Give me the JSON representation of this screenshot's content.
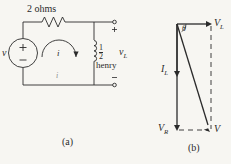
{
  "figure": {
    "background_color": "#f7f6f2",
    "ink_color": "#2b2b2b",
    "captions": {
      "left": "(a)",
      "right": "(b)"
    }
  },
  "circuit": {
    "name": "RL series circuit",
    "source_label": "v",
    "source_plus": "+",
    "source_minus": "−",
    "resistor_label": "2 ohms",
    "inductor_value_numerator": "1",
    "inductor_value_denominator": "2",
    "inductor_unit": "henry",
    "mesh_current_label": "i",
    "branch_current_label": "i",
    "output_label_base": "v",
    "output_label_sub": "L",
    "terminal_plus": "+",
    "terminal_minus": "−"
  },
  "phasor": {
    "name": "phasor diagram",
    "angle_label": "θ",
    "vectors": [
      {
        "name": "V_L",
        "base": "V",
        "sub": "L",
        "direction": "right",
        "style": "solid"
      },
      {
        "name": "I_L",
        "base": "I",
        "sub": "L",
        "direction": "down",
        "style": "solid"
      },
      {
        "name": "V_R",
        "base": "V",
        "sub": "R",
        "direction": "down",
        "style": "solid"
      },
      {
        "name": "V",
        "base": "V",
        "sub": "",
        "direction": "down-right",
        "style": "solid"
      }
    ],
    "dashed_segments": [
      "V_L to V (vertical right edge)",
      "V_R to V (horizontal bottom edge)"
    ],
    "labels": {
      "vl": "V",
      "vl_sub": "L",
      "il": "I",
      "il_sub": "L",
      "vr": "V",
      "vr_sub": "R",
      "v": "V"
    }
  }
}
